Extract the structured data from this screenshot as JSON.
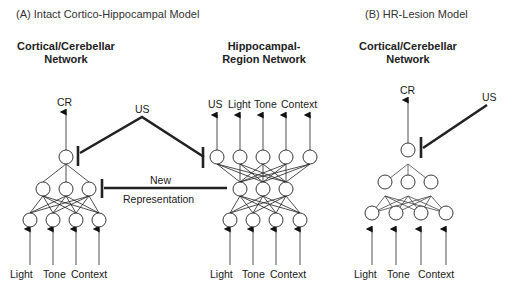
{
  "panel_a": {
    "title": "(A) Intact Cortico-Hippocampal Model",
    "cortical": {
      "header_line1": "Cortical/Cerebellar",
      "header_line2": "Network",
      "output_label": "CR",
      "inputs": [
        "Light",
        "Tone",
        "Context"
      ]
    },
    "hippocampal": {
      "header_line1": "Hippocampal-",
      "header_line2": "Region Network",
      "outputs": [
        "US",
        "Light",
        "Tone",
        "Context"
      ],
      "inputs": [
        "Light",
        "Tone",
        "Context"
      ]
    },
    "us_label": "US",
    "new_rep_line1": "New",
    "new_rep_line2": "Representation"
  },
  "panel_b": {
    "title": "(B) HR-Lesion Model",
    "header_line1": "Cortical/Cerebellar",
    "header_line2": "Network",
    "output_label": "CR",
    "us_label": "US",
    "inputs": [
      "Light",
      "Tone",
      "Context"
    ]
  }
}
